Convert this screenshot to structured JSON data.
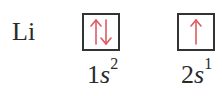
{
  "element": {
    "symbol": "Li"
  },
  "orbitals": [
    {
      "n": "1",
      "subshell": "s",
      "electrons": "2",
      "arrows": [
        "up",
        "down"
      ]
    },
    {
      "n": "2",
      "subshell": "s",
      "electrons": "1",
      "arrows": [
        "up"
      ]
    }
  ],
  "colors": {
    "arrow": "#dc5a5f",
    "box": "#333333",
    "text": "#2a2a2a"
  }
}
